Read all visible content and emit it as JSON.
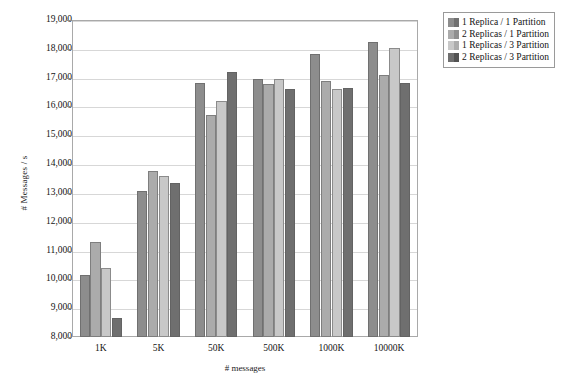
{
  "chart_data": {
    "type": "bar",
    "title": "",
    "xlabel": "# messages",
    "ylabel": "# Messages / s",
    "categories": [
      "1K",
      "5K",
      "50K",
      "500K",
      "1000K",
      "10000K"
    ],
    "ylim": [
      8000,
      19000
    ],
    "ytick_step": 1000,
    "yticks": [
      "8,000",
      "9,000",
      "10,000",
      "11,000",
      "12,000",
      "13,000",
      "14,000",
      "15,000",
      "16,000",
      "17,000",
      "18,000",
      "19,000"
    ],
    "grid": true,
    "legend_position": "right-top",
    "series": [
      {
        "name": "1 Replica / 1 Partition",
        "color": "#8d8d8d",
        "values": [
          10150,
          13050,
          16800,
          16970,
          17830,
          18220
        ]
      },
      {
        "name": "2 Replicas / 1 Partition",
        "color": "#ababab",
        "values": [
          11300,
          13750,
          15700,
          16770,
          16900,
          17080
        ]
      },
      {
        "name": "1 Replicas / 3 Partition",
        "color": "#c8c8c8",
        "values": [
          10380,
          13600,
          16180,
          16960,
          16620,
          18020
        ]
      },
      {
        "name": "2 Replicas / 3 Partition",
        "color": "#6f6f6f",
        "values": [
          8650,
          13350,
          17200,
          16600,
          16650,
          16820
        ]
      }
    ]
  }
}
